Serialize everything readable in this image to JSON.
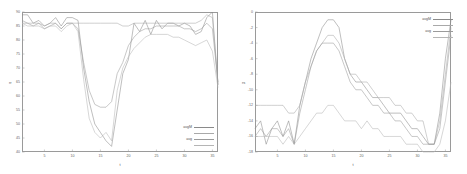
{
  "figure": {
    "panels": [
      {
        "name": "left-panel",
        "xlabel": "t",
        "ylabel": "rr",
        "xticks": [
          "5",
          "10",
          "15",
          "20",
          "25",
          "30",
          "35"
        ],
        "yticks": [
          "40",
          "45",
          "50",
          "55",
          "60",
          "65",
          "70",
          "75",
          "80",
          "85",
          "90"
        ],
        "legend": [
          {
            "label": "avgM",
            "color": "#8a8a8a"
          },
          {
            "label": "",
            "color": "#a9a9a9"
          },
          {
            "label": "avg",
            "color": "#9b9b9b"
          },
          {
            "label": "",
            "color": "#b5b5b5"
          }
        ]
      },
      {
        "name": "right-panel",
        "xlabel": "t",
        "ylabel": "rs",
        "xticks": [
          "5",
          "10",
          "15",
          "20",
          "25",
          "30",
          "35"
        ],
        "yticks": [
          "0",
          "-2",
          "-4",
          "-6",
          "-8",
          "-10",
          "-12",
          "-14",
          "-16",
          "-18"
        ],
        "legend": [
          {
            "label": "avgM",
            "color": "#8a8a8a"
          },
          {
            "label": "",
            "color": "#a9a9a9"
          },
          {
            "label": "avg",
            "color": "#9b9b9b"
          },
          {
            "label": "",
            "color": "#b5b5b5"
          }
        ]
      }
    ]
  },
  "chart_data": [
    {
      "type": "line",
      "title": "",
      "xlabel": "t",
      "ylabel": "rr",
      "xlim": [
        1,
        36
      ],
      "ylim": [
        40,
        90
      ],
      "grid": false,
      "legend_position": "bottom-right",
      "x": [
        1,
        2,
        3,
        4,
        5,
        6,
        7,
        8,
        9,
        10,
        11,
        12,
        13,
        14,
        15,
        16,
        17,
        18,
        19,
        20,
        21,
        22,
        23,
        24,
        25,
        26,
        27,
        28,
        29,
        30,
        31,
        32,
        33,
        34,
        35,
        36
      ],
      "series": [
        {
          "name": "avgM",
          "color": "#8a8a8a",
          "values": [
            89,
            89,
            86,
            87,
            85,
            86,
            88,
            85,
            88,
            88,
            87,
            70,
            58,
            50,
            47,
            44,
            42,
            55,
            68,
            73,
            86,
            83,
            87,
            82,
            87,
            84,
            86,
            86,
            85,
            86,
            85,
            82,
            83,
            88,
            90,
            64
          ]
        },
        {
          "name": "series-2",
          "color": "#a9a9a9",
          "values": [
            86,
            86,
            86,
            86,
            85,
            86,
            86,
            84,
            86,
            86,
            86,
            86,
            86,
            86,
            86,
            86,
            86,
            86,
            85,
            85,
            86,
            86,
            86,
            86,
            86,
            86,
            86,
            86,
            86,
            86,
            86,
            86,
            87,
            89,
            88,
            64
          ]
        },
        {
          "name": "avg",
          "color": "#9b9b9b",
          "values": [
            87,
            86,
            85,
            86,
            84,
            85,
            86,
            84,
            86,
            86,
            84,
            72,
            62,
            57,
            56,
            56,
            58,
            68,
            72,
            78,
            81,
            83,
            84,
            84,
            85,
            85,
            85,
            85,
            85,
            84,
            84,
            83,
            84,
            86,
            84,
            65
          ]
        },
        {
          "name": "series-4",
          "color": "#b5b5b5",
          "values": [
            86,
            85,
            85,
            85,
            84,
            85,
            85,
            83,
            85,
            86,
            83,
            66,
            52,
            47,
            45,
            47,
            44,
            62,
            70,
            74,
            77,
            79,
            81,
            82,
            82,
            82,
            82,
            81,
            81,
            80,
            79,
            78,
            79,
            80,
            76,
            63
          ]
        }
      ]
    },
    {
      "type": "line",
      "title": "",
      "xlabel": "t",
      "ylabel": "rs",
      "xlim": [
        1,
        36
      ],
      "ylim": [
        -18,
        0
      ],
      "grid": false,
      "legend_position": "top-right",
      "x": [
        1,
        2,
        3,
        4,
        5,
        6,
        7,
        8,
        9,
        10,
        11,
        12,
        13,
        14,
        15,
        16,
        17,
        18,
        19,
        20,
        21,
        22,
        23,
        24,
        25,
        26,
        27,
        28,
        29,
        30,
        31,
        32,
        33,
        34,
        35,
        36
      ],
      "series": [
        {
          "name": "avgM",
          "color": "#8a8a8a",
          "values": [
            -15,
            -14,
            -17,
            -15,
            -14,
            -16,
            -14,
            -17,
            -12,
            -9,
            -6,
            -4,
            -2,
            -1,
            -1,
            -2,
            -6,
            -8,
            -9,
            -9,
            -10,
            -11,
            -11,
            -12,
            -13,
            -13,
            -13,
            -14,
            -15,
            -15,
            -16,
            -17,
            -17,
            -13,
            -6,
            -1
          ]
        },
        {
          "name": "series-2",
          "color": "#a9a9a9",
          "values": [
            -12,
            -12,
            -12,
            -12,
            -12,
            -12,
            -13,
            -13,
            -12,
            -9,
            -7,
            -5,
            -4,
            -3,
            -3,
            -4,
            -6,
            -8,
            -8,
            -9,
            -9,
            -10,
            -11,
            -11,
            -11,
            -12,
            -12,
            -13,
            -13,
            -14,
            -14,
            -17,
            -17,
            -14,
            -8,
            -2
          ]
        },
        {
          "name": "avg",
          "color": "#9b9b9b",
          "values": [
            -16,
            -15,
            -16,
            -15,
            -15,
            -16,
            -15,
            -17,
            -13,
            -10,
            -7,
            -5,
            -4,
            -4,
            -4,
            -5,
            -7,
            -9,
            -10,
            -10,
            -11,
            -12,
            -12,
            -13,
            -13,
            -14,
            -14,
            -15,
            -16,
            -16,
            -17,
            -17,
            -17,
            -15,
            -9,
            -3
          ]
        },
        {
          "name": "series-4",
          "color": "#b5b5b5",
          "values": [
            -16,
            -16,
            -16,
            -16,
            -16,
            -17,
            -16,
            -17,
            -16,
            -15,
            -14,
            -13,
            -13,
            -12,
            -12,
            -13,
            -14,
            -14,
            -14,
            -15,
            -14,
            -15,
            -15,
            -16,
            -16,
            -16,
            -16,
            -17,
            -17,
            -17,
            -18,
            -18,
            -18,
            -17,
            -14,
            -9
          ]
        }
      ]
    }
  ]
}
